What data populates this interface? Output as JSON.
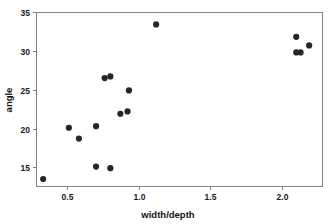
{
  "chart_data": {
    "type": "scatter",
    "title": "",
    "xlabel": "width/depth",
    "ylabel": "angle",
    "xlim": [
      0.28,
      2.28
    ],
    "ylim": [
      12.6,
      35.0
    ],
    "xticks": [
      0.5,
      1.0,
      1.5,
      2.0
    ],
    "xtick_labels": [
      "0.5",
      "1.0",
      "1.5",
      "2.0"
    ],
    "yticks": [
      15,
      20,
      25,
      30,
      35
    ],
    "ytick_labels": [
      "15",
      "20",
      "25",
      "30",
      "35"
    ],
    "grid": false,
    "legend": null,
    "marker": "filled-circle",
    "marker_color": "#262626",
    "axis_color": "#808080",
    "points": [
      {
        "x": 0.33,
        "y": 13.5
      },
      {
        "x": 0.51,
        "y": 20.1
      },
      {
        "x": 0.58,
        "y": 18.7
      },
      {
        "x": 0.7,
        "y": 20.3
      },
      {
        "x": 0.7,
        "y": 15.1
      },
      {
        "x": 0.76,
        "y": 26.5
      },
      {
        "x": 0.8,
        "y": 26.7
      },
      {
        "x": 0.8,
        "y": 14.9
      },
      {
        "x": 0.87,
        "y": 21.9
      },
      {
        "x": 0.92,
        "y": 22.2
      },
      {
        "x": 0.93,
        "y": 24.9
      },
      {
        "x": 1.12,
        "y": 33.4
      },
      {
        "x": 2.1,
        "y": 31.8
      },
      {
        "x": 2.1,
        "y": 29.8
      },
      {
        "x": 2.13,
        "y": 29.8
      },
      {
        "x": 2.19,
        "y": 30.7
      }
    ]
  },
  "axes": {
    "x_title": "width/depth",
    "y_title": "angle"
  }
}
